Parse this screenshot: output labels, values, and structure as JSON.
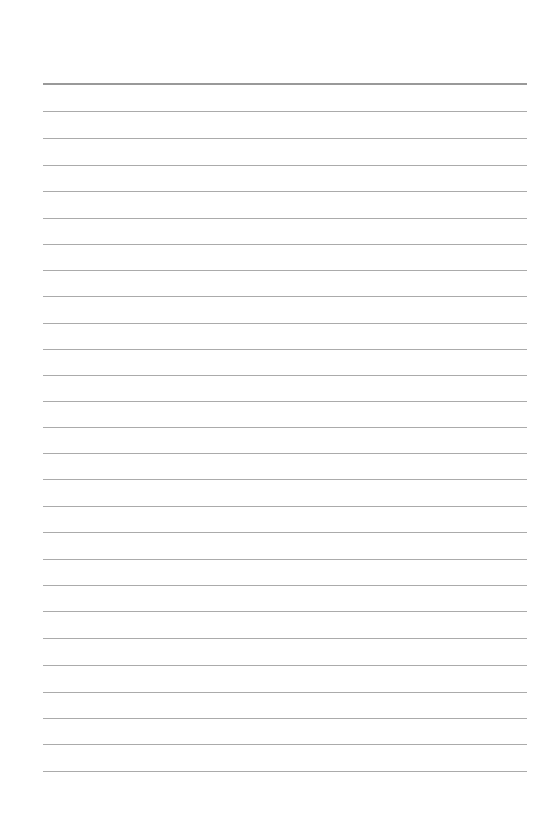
{
  "page": {
    "type": "lined-notepaper",
    "background_color": "#ffffff",
    "line_color": "#ababab",
    "header_line_color": "#999999",
    "margin_left_px": 43,
    "margin_right_px": 527,
    "header_line": {
      "y": 83,
      "thickness": 2
    },
    "ruled_lines_y": [
      111,
      138,
      165,
      191,
      218,
      244,
      270,
      296,
      323,
      349,
      375,
      401,
      427,
      453,
      479,
      506,
      532,
      559,
      585,
      611,
      638,
      665,
      692,
      718,
      744,
      771
    ],
    "text_content": []
  }
}
